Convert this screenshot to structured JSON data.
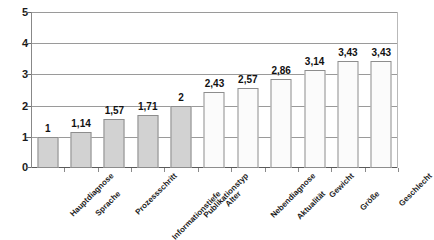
{
  "chart_data": {
    "type": "bar",
    "title": "",
    "subtitle": "",
    "xlabel": "",
    "ylabel": "",
    "ylim": [
      0,
      5
    ],
    "yticks": [
      0,
      1,
      2,
      3,
      4,
      5
    ],
    "ytick_labels": [
      "0",
      "1",
      "2",
      "3",
      "4",
      "5"
    ],
    "grid": true,
    "legend": false,
    "decimal_separator": ",",
    "categories": [
      "Hauptdiagnose",
      "Sprache",
      "Prozessschritt",
      "Informationstiefe",
      "Publikationstyp",
      "Alter",
      "Nebendiagnose",
      "Aktualität",
      "Gewicht",
      "Größe",
      "Geschlecht"
    ],
    "values": [
      1,
      1.14,
      1.57,
      1.71,
      2,
      2.43,
      2.57,
      2.86,
      3.14,
      3.43,
      3.43
    ],
    "value_labels": [
      "1",
      "1,14",
      "1,57",
      "1,71",
      "2",
      "2,43",
      "2,57",
      "2,86",
      "3,14",
      "3,43",
      "3,43"
    ],
    "bar_fills": [
      "gray",
      "gray",
      "gray",
      "gray",
      "gray",
      "white",
      "white",
      "white",
      "white",
      "white",
      "white"
    ],
    "colors": {
      "bar_gray": "#d2d2d2",
      "bar_white": "#fbfbfb",
      "bar_border": "#8d8d8d",
      "gridline": "#9a9a9a",
      "axis": "#5a5a5a",
      "text": "#111111",
      "background": "#ffffff"
    }
  }
}
